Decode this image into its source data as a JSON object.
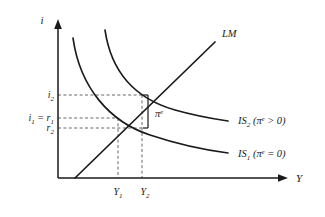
{
  "figure": {
    "background_color": "#ffffff",
    "stroke_color": "#1a1a1a",
    "dash_color": "#555555"
  },
  "axes": {
    "y_label": "i",
    "x_label": "Y",
    "origin": {
      "x": 58,
      "y": 178
    },
    "y_top": {
      "x": 58,
      "y": 22
    },
    "x_right": {
      "x": 285,
      "y": 178
    }
  },
  "y_ticks": [
    {
      "id": "i2",
      "base": "i",
      "sub": "2",
      "value_y": 95,
      "label": "i₂"
    },
    {
      "id": "i1r1",
      "base": "i",
      "sub": "1",
      "base2": "r",
      "sub2": "1",
      "eq": " = ",
      "value_y": 118,
      "label": "i₁ = r₁"
    },
    {
      "id": "r2",
      "base": "r",
      "sub": "2",
      "value_y": 128,
      "label": "r₂"
    }
  ],
  "x_ticks": [
    {
      "id": "Y1",
      "base": "Y",
      "sub": "1",
      "value_x": 118,
      "label": "Y₁"
    },
    {
      "id": "Y2",
      "base": "Y",
      "sub": "2",
      "value_x": 142,
      "label": "Y₂"
    }
  ],
  "curves": [
    {
      "id": "LM",
      "label": "LM",
      "type": "line",
      "label_x": 222,
      "label_y": 34,
      "path": "M 75 178 L 215 42"
    },
    {
      "id": "IS2",
      "label_base": "IS",
      "label_sub": "2",
      "label_paren_open": " (",
      "label_pi": "π",
      "label_pi_sup": "e",
      "label_rel": " > 0)",
      "label": "IS₂ (πᵉ > 0)",
      "type": "curve",
      "label_x": 238,
      "label_y": 121,
      "path": "M 105 30 C 112 78, 140 100, 175 110 C 200 117, 215 119, 228 121"
    },
    {
      "id": "IS1",
      "label_base": "IS",
      "label_sub": "1",
      "label_paren_open": " (",
      "label_pi": "π",
      "label_pi_sup": "e",
      "label_rel": " = 0)",
      "label": "IS₁ (πᵉ = 0)",
      "type": "curve",
      "label_x": 238,
      "label_y": 154,
      "path": "M 73 38 C 80 88, 110 122, 150 135 C 180 145, 205 150, 228 153"
    }
  ],
  "intersections": [
    {
      "id": "E2",
      "x": 142,
      "y": 95,
      "note": "LM crosses IS2"
    },
    {
      "id": "E1",
      "x": 118,
      "y": 118,
      "note": "LM crosses IS1"
    },
    {
      "id": "P3",
      "x": 142,
      "y": 128,
      "note": "IS1 at Y2"
    }
  ],
  "bracket": {
    "label_base": "π",
    "label_sup": "e",
    "label": "πᵉ",
    "x": 148,
    "y_top": 95,
    "y_bottom": 128,
    "label_x": 155,
    "label_y": 114
  }
}
